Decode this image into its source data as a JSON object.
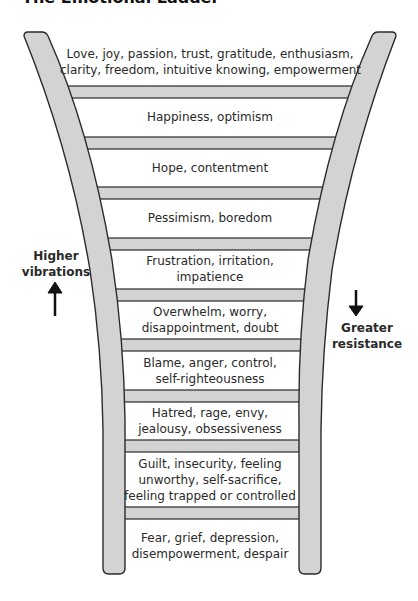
{
  "title": "The Emotional Ladder",
  "colors": {
    "rail_fill": "#d3d3d3",
    "rail_stroke": "#2b2b2b",
    "rung_fill": "#d3d3d3",
    "text": "#2a2a2a"
  },
  "side_labels": {
    "left": {
      "line1": "Higher",
      "line2": "vibrations",
      "arrow": "up-arrow"
    },
    "right": {
      "line1": "Greater",
      "line2": "resistance",
      "arrow": "down-arrow"
    }
  },
  "steps": [
    {
      "lines": [
        "Love, joy, passion, trust, gratitude, enthusiasm,",
        "clarity, freedom, intuitive knowing, empowerment"
      ]
    },
    {
      "lines": [
        "Happiness, optimism"
      ]
    },
    {
      "lines": [
        "Hope, contentment"
      ]
    },
    {
      "lines": [
        "Pessimism, boredom"
      ]
    },
    {
      "lines": [
        "Frustration, irritation,",
        "impatience"
      ]
    },
    {
      "lines": [
        "Overwhelm, worry,",
        "disappointment, doubt"
      ]
    },
    {
      "lines": [
        "Blame, anger, control,",
        "self-righteousness"
      ]
    },
    {
      "lines": [
        "Hatred, rage, envy,",
        "jealousy, obsessiveness"
      ]
    },
    {
      "lines": [
        "Guilt, insecurity, feeling",
        "unworthy, self-sacrifice,",
        "feeling trapped or controlled"
      ]
    },
    {
      "lines": [
        "Fear, grief, depression,",
        "disempowerment, despair"
      ]
    }
  ]
}
